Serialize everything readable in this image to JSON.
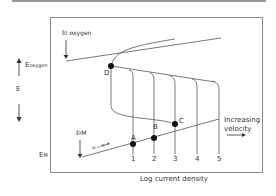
{
  "diagram": {
    "y_axis": {
      "e_oxygen": "E",
      "e_oxygen_sub": "oxygen",
      "e_label": "E",
      "e_m": "E",
      "e_m_sub": "M"
    },
    "x_axis_label": "Log current density",
    "i0_oxygen": "I",
    "i0_oxygen_sub": "0",
    "i0_oxygen_sub2": "oxygen",
    "i0_m": "I",
    "i0_m_sub": "0",
    "i0_m_sub2": "M",
    "reaction": "M → M⁺",
    "points": [
      "A",
      "B",
      "C",
      "D"
    ],
    "curve_numbers": [
      "1",
      "2",
      "3",
      "4",
      "5"
    ],
    "annotation_line1": "Increasing",
    "annotation_line2": "velocity"
  }
}
